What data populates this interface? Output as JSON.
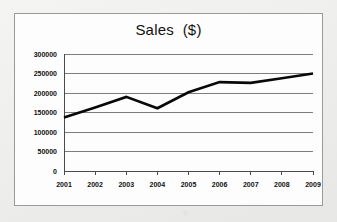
{
  "chart_data": {
    "type": "line",
    "title": "Sales  ($)",
    "xlabel": "",
    "ylabel": "",
    "categories": [
      "2001",
      "2002",
      "2003",
      "2004",
      "2005",
      "2006",
      "2007",
      "2008",
      "2009"
    ],
    "values": [
      137000,
      163000,
      190000,
      161000,
      202000,
      228000,
      226000,
      238000,
      250000
    ],
    "series": [
      {
        "name": "Sales",
        "values": [
          137000,
          163000,
          190000,
          161000,
          202000,
          228000,
          226000,
          238000,
          250000
        ]
      }
    ],
    "ylim": [
      0,
      300000
    ],
    "ytick_values": [
      0,
      50000,
      100000,
      150000,
      200000,
      250000,
      300000
    ],
    "ytick_labels": [
      "0",
      "50000",
      "100000",
      "150000",
      "200000",
      "250000",
      "300000"
    ],
    "xtick_labels": [
      "2001",
      "2002",
      "2003",
      "2004",
      "2005",
      "2006",
      "2007",
      "2008",
      "2009"
    ],
    "grid": "horizontal",
    "legend": "none",
    "line_color": "#080808",
    "plot_background": "#fdfdfd",
    "frame_border_color": "#9a9a9a",
    "annotations": []
  }
}
